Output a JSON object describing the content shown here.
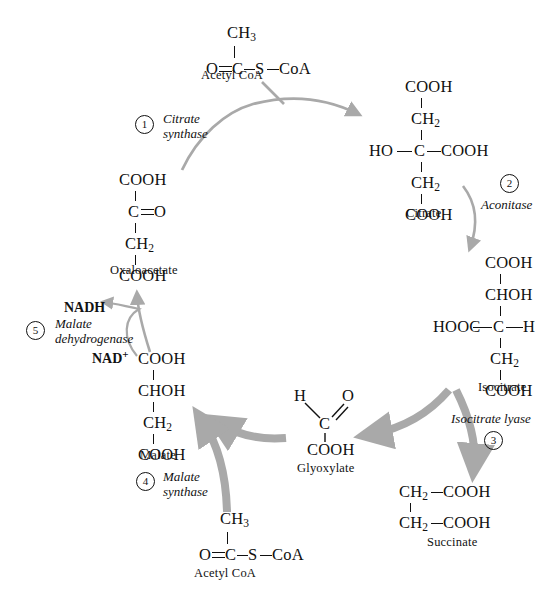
{
  "diagram": {
    "arrow_color": "#a9a9a9",
    "text_color": "#111111"
  },
  "molecules": {
    "acetyl_coa_top": {
      "name": "Acetyl CoA",
      "top_group": "CH",
      "top_sub": "3",
      "left_atom": "O",
      "center_atom": "C",
      "sulfur": "S",
      "coa": "CoA"
    },
    "citrate": {
      "name": "Citrate",
      "rows": [
        "COOH",
        "CH",
        "HO",
        "C",
        "COOH",
        "CH",
        "COOH"
      ],
      "r1": "COOH",
      "r2": "CH",
      "r2_sub": "2",
      "r3_left": "HO",
      "r3_center": "C",
      "r3_right": "COOH",
      "r4": "CH",
      "r4_sub": "2",
      "r5": "COOH"
    },
    "isocitrate": {
      "name": "Isocitrate",
      "r1": "COOH",
      "r2": "CHOH",
      "r3_left": "HOOC",
      "r3_center": "C",
      "r3_right": "H",
      "r4": "CH",
      "r4_sub": "2",
      "r5": "COOH"
    },
    "succinate": {
      "name": "Succinate",
      "r1_left": "CH",
      "r1_sub": "2",
      "r1_right": "COOH",
      "r2_left": "CH",
      "r2_sub": "2",
      "r2_right": "COOH"
    },
    "glyoxylate": {
      "name": "Glyoxylate",
      "h_atom": "H",
      "o_atom": "O",
      "center_atom": "C",
      "cooh": "COOH"
    },
    "acetyl_coa_bottom": {
      "name": "Acetyl CoA",
      "top_group": "CH",
      "top_sub": "3",
      "left_atom": "O",
      "center_atom": "C",
      "sulfur": "S",
      "coa": "CoA"
    },
    "malate": {
      "name": "Malate",
      "r1": "COOH",
      "r2": "CHOH",
      "r3": "CH",
      "r3_sub": "2",
      "r4": "COOH"
    },
    "oxaloacetate": {
      "name": "Oxaloacetate",
      "r1": "COOH",
      "r2_center": "C",
      "r2_right": "O",
      "r3": "CH",
      "r3_sub": "2",
      "r4": "COOH"
    }
  },
  "enzymes": [
    {
      "number": "1",
      "line1": "Citrate",
      "line2": "synthase"
    },
    {
      "number": "2",
      "line1": "Aconitase",
      "line2": ""
    },
    {
      "number": "3",
      "line1": "Isocitrate lyase",
      "line2": ""
    },
    {
      "number": "4",
      "line1": "Malate",
      "line2": "synthase"
    },
    {
      "number": "5",
      "line1": "Malate",
      "line2": "dehydrogenase"
    }
  ],
  "cofactors": {
    "nadh": "NADH",
    "nad_plus": "NAD",
    "nad_plus_charge": "+"
  }
}
